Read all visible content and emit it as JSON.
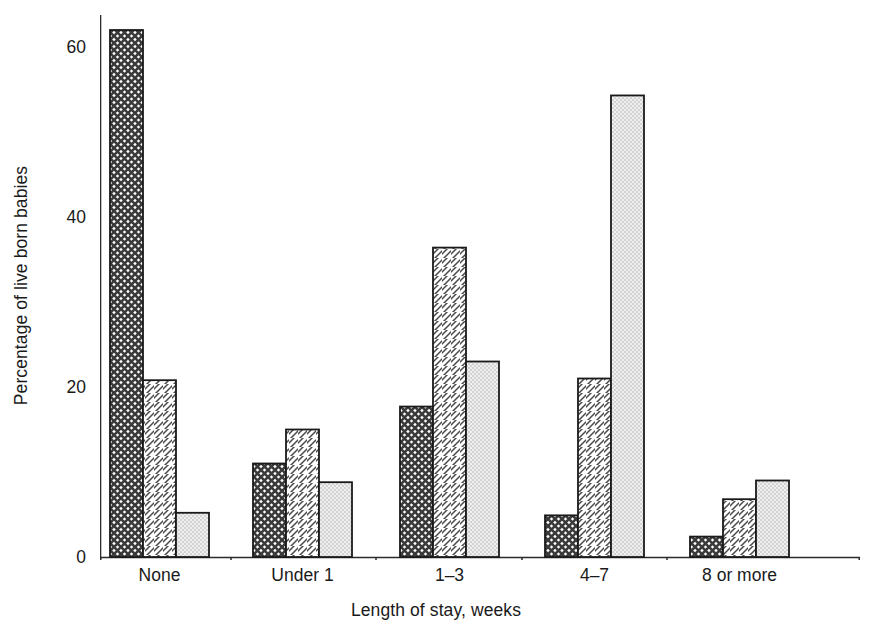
{
  "chart_data": {
    "type": "bar",
    "title": "",
    "subtitle": "",
    "xlabel": "Length of stay, weeks",
    "ylabel": "Percentage of live born babies",
    "categories": [
      "None",
      "Under 1",
      "1–3",
      "4–7",
      "8 or more"
    ],
    "series": [
      {
        "name": "series-1",
        "pattern": "cross-hatch-dark",
        "values": [
          62.0,
          11.0,
          17.7,
          4.9,
          2.4
        ]
      },
      {
        "name": "series-2",
        "pattern": "diagonal-hatch",
        "values": [
          20.8,
          15.0,
          36.4,
          21.0,
          6.8
        ]
      },
      {
        "name": "series-3",
        "pattern": "stipple-light",
        "values": [
          5.2,
          8.8,
          23.0,
          54.3,
          9.0
        ]
      }
    ],
    "ylim": [
      0,
      64
    ],
    "y_major_ticks": [
      0,
      20,
      40,
      60
    ],
    "y_minor_ticks": [
      10,
      30,
      50
    ],
    "y_tick_labels": [
      "0",
      "20",
      "40",
      "60"
    ],
    "grid": false,
    "legend": "none",
    "legend_position": "none",
    "axis_color": "#2b2b2b",
    "bar_edge_color": "#1a1a1a",
    "background_color": "#ffffff",
    "annotations": []
  },
  "figure": {
    "caption": ""
  }
}
